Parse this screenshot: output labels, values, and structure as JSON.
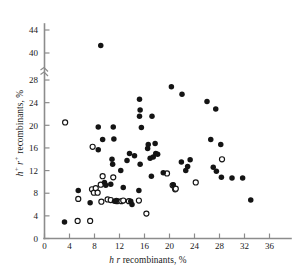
{
  "chart_data": {
    "type": "scatter",
    "title": "",
    "xlabel": "h r recombinants, %",
    "ylabel": "h+ r+ recombinants, %",
    "xlabel_parts": {
      "italic": "h r",
      "plain": " recombinants, %"
    },
    "ylabel_parts": {
      "italic_sup": "h+ r+",
      "plain": " recombinants, %"
    },
    "xlim": [
      0,
      38
    ],
    "ylim": [
      0,
      45
    ],
    "grid": false,
    "legend": "none",
    "xticks": [
      0,
      4,
      8,
      12,
      16,
      20,
      24,
      28,
      32,
      36
    ],
    "xtick_labels": [
      "0",
      "4",
      "8",
      "12",
      "16",
      "20",
      "24",
      "28",
      "32",
      "36"
    ],
    "yticks": [
      0,
      4,
      8,
      12,
      16,
      20,
      24,
      28,
      40,
      44
    ],
    "ytick_labels": [
      "0",
      "4",
      "8",
      "12",
      "16",
      "20",
      "24",
      "28",
      "40",
      "44"
    ],
    "y_axis_break": {
      "after": 28,
      "before": 40,
      "note": "axis break between 28 and 40"
    },
    "series": [
      {
        "name": "filled",
        "marker": "filled-circle",
        "color": "#141414",
        "points": [
          [
            3.2,
            2.9
          ],
          [
            7.3,
            6.3
          ],
          [
            5.4,
            8.5
          ],
          [
            8.6,
            19.7
          ],
          [
            9.0,
            41.3
          ],
          [
            8.6,
            15.7
          ],
          [
            9.3,
            17.5
          ],
          [
            9.6,
            9.9
          ],
          [
            9.8,
            9.4
          ],
          [
            10.6,
            9.6
          ],
          [
            10.9,
            13.1
          ],
          [
            11.0,
            19.7
          ],
          [
            11.1,
            17.6
          ],
          [
            10.8,
            14.0
          ],
          [
            11.2,
            6.6
          ],
          [
            11.5,
            6.7
          ],
          [
            12.2,
            12.0
          ],
          [
            12.6,
            9.0
          ],
          [
            13.2,
            13.8
          ],
          [
            13.6,
            15.0
          ],
          [
            13.8,
            6.6
          ],
          [
            14.0,
            6.0
          ],
          [
            14.4,
            14.6
          ],
          [
            15.2,
            24.6
          ],
          [
            15.3,
            22.7
          ],
          [
            15.1,
            8.5
          ],
          [
            15.5,
            19.6
          ],
          [
            15.3,
            13.1
          ],
          [
            15.2,
            29.0
          ],
          [
            16.5,
            15.9
          ],
          [
            16.6,
            16.6
          ],
          [
            16.9,
            14.2
          ],
          [
            17.1,
            11.0
          ],
          [
            17.4,
            14.4
          ],
          [
            17.2,
            29.0
          ],
          [
            17.7,
            16.8
          ],
          [
            17.8,
            15.0
          ],
          [
            18.1,
            14.9
          ],
          [
            19.0,
            11.6
          ],
          [
            20.3,
            26.8
          ],
          [
            20.6,
            9.5
          ],
          [
            22.0,
            25.5
          ],
          [
            21.9,
            13.5
          ],
          [
            22.6,
            12.0
          ],
          [
            22.9,
            12.7
          ],
          [
            23.3,
            13.9
          ],
          [
            26.0,
            24.2
          ],
          [
            26.6,
            17.5
          ],
          [
            27.0,
            12.6
          ],
          [
            27.4,
            22.9
          ],
          [
            27.5,
            11.9
          ],
          [
            28.2,
            16.6
          ],
          [
            28.3,
            10.8
          ],
          [
            30.0,
            10.7
          ],
          [
            31.7,
            10.7
          ],
          [
            33.0,
            6.8
          ]
        ]
      },
      {
        "name": "open",
        "marker": "open-circle",
        "color": "#ffffff",
        "edge_color": "#141414",
        "points": [
          [
            3.3,
            20.5
          ],
          [
            5.3,
            3.1
          ],
          [
            5.4,
            7.0
          ],
          [
            7.3,
            3.1
          ],
          [
            7.7,
            16.2
          ],
          [
            7.6,
            8.7
          ],
          [
            7.9,
            8.1
          ],
          [
            8.2,
            8.9
          ],
          [
            8.5,
            8.1
          ],
          [
            9.0,
            9.5
          ],
          [
            9.3,
            11.0
          ],
          [
            9.1,
            6.5
          ],
          [
            10.1,
            6.9
          ],
          [
            10.6,
            6.8
          ],
          [
            11.0,
            10.8
          ],
          [
            11.6,
            6.6
          ],
          [
            12.3,
            6.6
          ],
          [
            12.6,
            6.7
          ],
          [
            13.5,
            6.6
          ],
          [
            15.1,
            6.7
          ],
          [
            16.3,
            4.4
          ],
          [
            19.6,
            11.5
          ],
          [
            20.5,
            9.4
          ],
          [
            20.9,
            8.7
          ],
          [
            21.0,
            8.8
          ],
          [
            24.2,
            9.9
          ],
          [
            28.4,
            14.0
          ]
        ]
      }
    ]
  },
  "axes": {
    "x_axis_name": "x-axis",
    "y_axis_name": "y-axis"
  }
}
